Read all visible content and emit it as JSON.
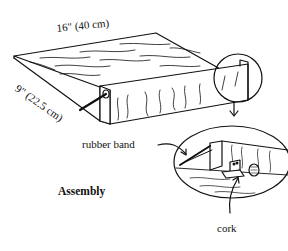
{
  "diagram": {
    "caption": "Assembly",
    "dimensions": {
      "length": "16\" (40 cm)",
      "width": "9\" (22.5 cm)"
    },
    "callouts": {
      "rubber_band": "rubber band",
      "cork": "cork"
    },
    "colors": {
      "line": "#111111",
      "background": "#ffffff"
    }
  }
}
